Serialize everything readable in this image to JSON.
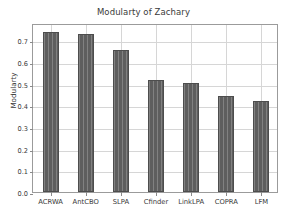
{
  "chart_data": {
    "type": "bar",
    "title": "Modularty of Zachary",
    "xlabel": "",
    "ylabel": "Modularty",
    "categories": [
      "ACRWA",
      "AntCBO",
      "SLPA",
      "Cfinder",
      "LinkLPA",
      "COPRA",
      "LFM"
    ],
    "values": [
      0.737,
      0.727,
      0.655,
      0.515,
      0.501,
      0.443,
      0.421
    ],
    "ylim": [
      0.0,
      0.78
    ],
    "yticks": [
      "0.0",
      "0.1",
      "0.2",
      "0.3",
      "0.4",
      "0.5",
      "0.6",
      "0.7"
    ],
    "ytick_values": [
      0.0,
      0.1,
      0.2,
      0.3,
      0.4,
      0.5,
      0.6,
      0.7
    ],
    "grid": true,
    "legend": null,
    "bar_color": "#5e5e5e",
    "grid_color": "#d6d6d6",
    "axis_color": "#9b9b9b",
    "background_color": "#ffffff"
  }
}
